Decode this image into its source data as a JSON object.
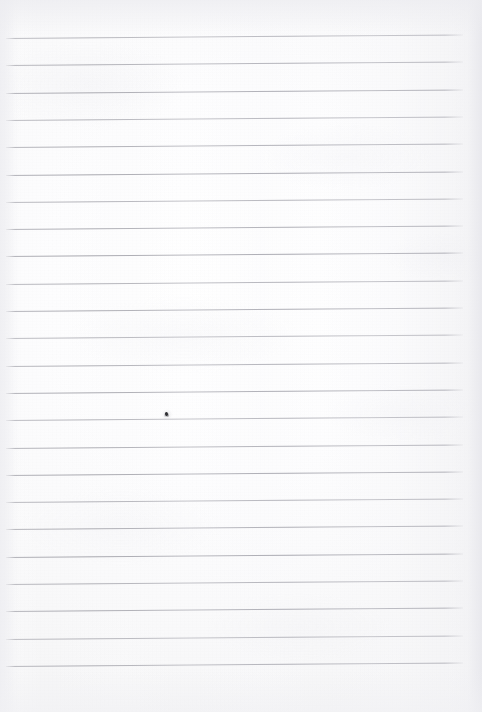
{
  "document": {
    "kind": "scanned-ruled-notebook-page",
    "title": "Blank Ruled Notebook Page",
    "written_text": "",
    "page_number": "",
    "header_text": "",
    "footer_text": ""
  },
  "page": {
    "width": 482,
    "height": 712,
    "paper_color": "#fdfdfd",
    "edge_shadow_color": "#ececf0"
  },
  "ruling": {
    "line_color": "#a9a9b1",
    "line_thickness": 1,
    "line_count": 24,
    "first_line_y": 38,
    "line_spacing": 27.3,
    "left_x": 6,
    "right_x": 463,
    "skew_px": -3.5,
    "margin_rule": "none",
    "top_margin_px": 38,
    "bottom_margin_px": 39
  },
  "marks": [
    {
      "name": "ink-speck",
      "x": 165,
      "y": 412,
      "color": "#2f2f33",
      "note": ""
    }
  ]
}
